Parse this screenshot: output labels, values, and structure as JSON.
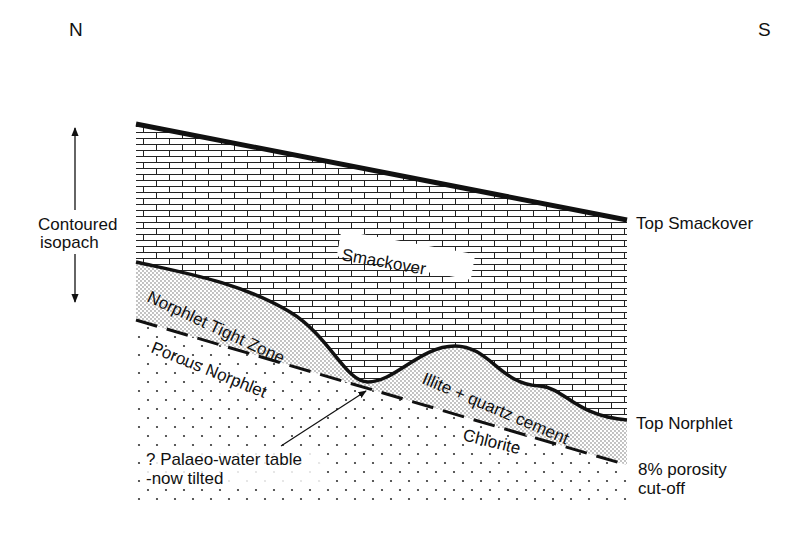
{
  "compass": {
    "north": "N",
    "south": "S"
  },
  "isopach_label": {
    "line1": "Contoured",
    "line2": "isopach"
  },
  "units": {
    "smackover": "Smackover",
    "tight_zone": "Norphlet Tight Zone",
    "porous": "Porous Norphlet",
    "illite": "Illite + quartz cement",
    "chlorite": "Chlorite"
  },
  "right_labels": {
    "top_smackover": "Top Smackover",
    "top_norphlet": "Top Norphlet",
    "cutoff_line1": "8% porosity",
    "cutoff_line2": "cut-off"
  },
  "annotation": {
    "line1": "? Palaeo-water table",
    "line2": "-now tilted"
  },
  "patterns": {
    "smackover": "brick (limestone)",
    "tight_zone": "fine stipple",
    "porous": "sparse dots"
  },
  "colors": {
    "ink": "#111111",
    "paper": "#ffffff"
  }
}
